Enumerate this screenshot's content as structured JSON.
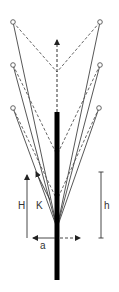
{
  "diagram": {
    "labels": {
      "H": "H",
      "K": "K",
      "a": "a",
      "h": "h"
    },
    "colors": {
      "line": "#444444",
      "stem": "#000000",
      "dash": "#555555"
    },
    "nodes": [
      {
        "id": "top-left",
        "x": 13,
        "y": 22
      },
      {
        "id": "top-right",
        "x": 100,
        "y": 22
      },
      {
        "id": "mid-left",
        "x": 13,
        "y": 65
      },
      {
        "id": "mid-right",
        "x": 100,
        "y": 65
      },
      {
        "id": "low-left",
        "x": 13,
        "y": 108
      },
      {
        "id": "low-right",
        "x": 99,
        "y": 108
      }
    ]
  }
}
